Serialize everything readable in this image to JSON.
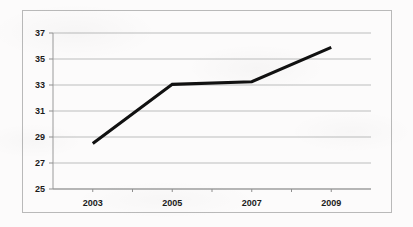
{
  "chart_data": {
    "type": "line",
    "title": "",
    "subtitle": "",
    "xlabel": "",
    "ylabel": "",
    "x": [
      2003,
      2005,
      2007,
      2009
    ],
    "categories": [
      "2003",
      "2005",
      "2007",
      "2009"
    ],
    "values": [
      28.5,
      33.05,
      33.25,
      35.9
    ],
    "series": [
      {
        "name": "",
        "values": [
          28.5,
          33.05,
          33.25,
          35.9
        ]
      }
    ],
    "ylim": [
      25,
      37
    ],
    "yticks": [
      25,
      27,
      29,
      31,
      33,
      35,
      37
    ],
    "ytick_labels": [
      "25",
      "27",
      "29",
      "31",
      "33",
      "35",
      "37"
    ],
    "xtick_labels": [
      "2003",
      "2005",
      "2007",
      "2009"
    ],
    "xlim": [
      2002,
      2010
    ],
    "grid": "horizontal",
    "legend": "none",
    "line_color": "#111111",
    "grid_color": "#b5b5b5",
    "axis_color": "#8f8f8f",
    "border_color": "#b9b9b9",
    "background_color": "#fcfbfb",
    "annotations": []
  }
}
